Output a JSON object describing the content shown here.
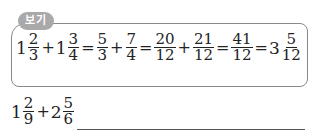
{
  "example": {
    "badge_label": "보기",
    "expression": [
      {
        "type": "mixed",
        "whole": "1",
        "num": "2",
        "den": "3"
      },
      {
        "type": "op",
        "text": "+"
      },
      {
        "type": "mixed",
        "whole": "1",
        "num": "3",
        "den": "4"
      },
      {
        "type": "op",
        "text": "="
      },
      {
        "type": "frac",
        "num": "5",
        "den": "3"
      },
      {
        "type": "op",
        "text": "+"
      },
      {
        "type": "frac",
        "num": "7",
        "den": "4"
      },
      {
        "type": "op",
        "text": "="
      },
      {
        "type": "frac",
        "num": "20",
        "den": "12"
      },
      {
        "type": "op",
        "text": "+"
      },
      {
        "type": "frac",
        "num": "21",
        "den": "12"
      },
      {
        "type": "op",
        "text": "="
      },
      {
        "type": "frac",
        "num": "41",
        "den": "12"
      },
      {
        "type": "op",
        "text": "="
      },
      {
        "type": "mixed",
        "whole": "3",
        "num": "5",
        "den": "12"
      }
    ]
  },
  "problem": {
    "expression": [
      {
        "type": "mixed",
        "whole": "1",
        "num": "2",
        "den": "9"
      },
      {
        "type": "op",
        "text": "+"
      },
      {
        "type": "mixed",
        "whole": "2",
        "num": "5",
        "den": "6"
      }
    ],
    "answer": ""
  }
}
